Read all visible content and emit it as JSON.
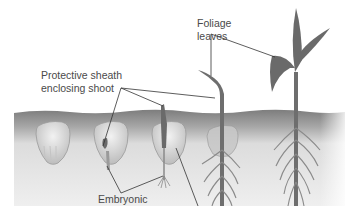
{
  "diagram": {
    "labels": {
      "sheath_line1": "Protective sheath",
      "sheath_line2": "enclosing shoot",
      "foliage_line1": "Foliage",
      "foliage_line2": "leaves",
      "embryonic": "Embryonic"
    },
    "stages": [
      {
        "id": 1,
        "description": "seed in soil"
      },
      {
        "id": 2,
        "description": "sheath emerging from seed, embryonic root"
      },
      {
        "id": 3,
        "description": "sheath reaching soil surface, roots beginning"
      },
      {
        "id": 4,
        "description": "first foliage leaf emerging, root system"
      },
      {
        "id": 5,
        "description": "seedling with foliage leaves and fibrous roots"
      }
    ],
    "colors": {
      "background": "#ffffff",
      "soil_dark": "#8a8a8a",
      "soil_light": "#ececec",
      "plant": "#6e6e6e",
      "seed": "#d8d8d8",
      "leader_line": "#333333",
      "text": "#4a4a4a"
    }
  }
}
